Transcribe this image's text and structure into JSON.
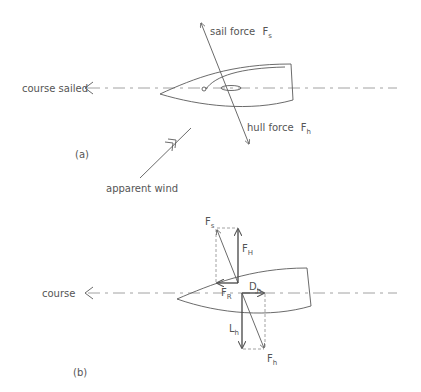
{
  "figure_a": {
    "panel_label": "(a)",
    "course_label": "course sailed",
    "sail_force_label": "sail force",
    "sail_force_symbol": "F",
    "sail_force_sub": "s",
    "hull_force_label": "hull force",
    "hull_force_symbol": "F",
    "hull_force_sub": "h",
    "wind_label": "apparent wind"
  },
  "figure_b": {
    "panel_label": "(b)",
    "course_label": "course",
    "vectors": [
      {
        "symbol": "F",
        "sub": "s",
        "meaning": "sail force"
      },
      {
        "symbol": "F",
        "sub": "H",
        "meaning": "heeling component"
      },
      {
        "symbol": "F",
        "sub": "R",
        "meaning": "driving component"
      },
      {
        "symbol": "D",
        "sub": "h",
        "meaning": "hull drag"
      },
      {
        "symbol": "L",
        "sub": "h",
        "meaning": "hull lift"
      },
      {
        "symbol": "F",
        "sub": "h",
        "meaning": "hull force"
      }
    ]
  },
  "colors": {
    "line": "#5a5a5a",
    "dashed": "#8a8a8a",
    "text": "#555555",
    "background": "#ffffff"
  }
}
